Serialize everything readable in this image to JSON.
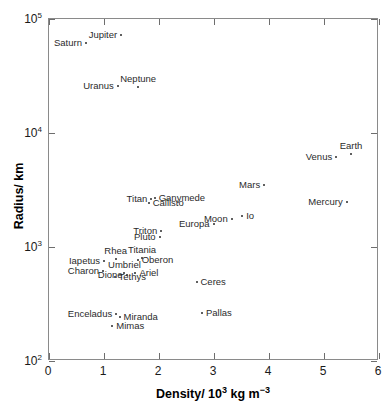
{
  "chart_data": {
    "type": "scatter",
    "title": "",
    "xlabel": "Density/ 10³ kg m⁻³",
    "ylabel": "Radius/ km",
    "xlim": [
      0,
      6
    ],
    "ylim": [
      100,
      100000
    ],
    "yscale": "log",
    "xscale": "linear",
    "grid": false,
    "legend": "none",
    "xticks": [
      {
        "value": 0,
        "label": "0"
      },
      {
        "value": 1,
        "label": "1"
      },
      {
        "value": 2,
        "label": "2"
      },
      {
        "value": 3,
        "label": "3"
      },
      {
        "value": 4,
        "label": "4"
      },
      {
        "value": 5,
        "label": "5"
      },
      {
        "value": 6,
        "label": "6"
      }
    ],
    "yticks": [
      {
        "value": 100,
        "label": "10",
        "exp": "2"
      },
      {
        "value": 1000,
        "label": "10",
        "exp": "3"
      },
      {
        "value": 10000,
        "label": "10",
        "exp": "4"
      },
      {
        "value": 100000,
        "label": "10",
        "exp": "5"
      }
    ],
    "points": [
      {
        "name": "Jupiter",
        "x": 1.33,
        "y": 71490,
        "side": "rl"
      },
      {
        "name": "Saturn",
        "x": 0.69,
        "y": 60270,
        "side": "rl"
      },
      {
        "name": "Uranus",
        "x": 1.27,
        "y": 25560,
        "side": "rl"
      },
      {
        "name": "Neptune",
        "x": 1.64,
        "y": 24760,
        "side": "ct"
      },
      {
        "name": "Earth",
        "x": 5.51,
        "y": 6378,
        "side": "ct"
      },
      {
        "name": "Venus",
        "x": 5.24,
        "y": 6052,
        "side": "rl"
      },
      {
        "name": "Mars",
        "x": 3.93,
        "y": 3397,
        "side": "rl"
      },
      {
        "name": "Mercury",
        "x": 5.43,
        "y": 2440,
        "side": "rl"
      },
      {
        "name": "Ganymede",
        "x": 1.94,
        "y": 2631,
        "side": "lr"
      },
      {
        "name": "Titan",
        "x": 1.88,
        "y": 2575,
        "side": "rl"
      },
      {
        "name": "Callisto",
        "x": 1.83,
        "y": 2400,
        "side": "lr"
      },
      {
        "name": "Io",
        "x": 3.53,
        "y": 1821,
        "side": "lr"
      },
      {
        "name": "Moon",
        "x": 3.34,
        "y": 1738,
        "side": "rl"
      },
      {
        "name": "Europa",
        "x": 3.01,
        "y": 1565,
        "side": "rl"
      },
      {
        "name": "Triton",
        "x": 2.06,
        "y": 1353,
        "side": "rl"
      },
      {
        "name": "Pluto",
        "x": 2.03,
        "y": 1195,
        "side": "rl"
      },
      {
        "name": "Titania",
        "x": 1.71,
        "y": 789,
        "side": "ct"
      },
      {
        "name": "Oberon",
        "x": 1.63,
        "y": 761,
        "side": "lr"
      },
      {
        "name": "Rhea",
        "x": 1.23,
        "y": 764,
        "side": "ct"
      },
      {
        "name": "Iapetus",
        "x": 1.02,
        "y": 736,
        "side": "rl"
      },
      {
        "name": "Charon",
        "x": 1.0,
        "y": 606,
        "side": "rl"
      },
      {
        "name": "Umbriel",
        "x": 1.39,
        "y": 585,
        "side": "ct"
      },
      {
        "name": "Ariel",
        "x": 1.59,
        "y": 579,
        "side": "lr"
      },
      {
        "name": "Dione",
        "x": 1.43,
        "y": 560,
        "side": "rl"
      },
      {
        "name": "Tethys",
        "x": 1.21,
        "y": 530,
        "side": "lr"
      },
      {
        "name": "Ceres",
        "x": 2.7,
        "y": 487,
        "side": "lr"
      },
      {
        "name": "Enceladus",
        "x": 1.24,
        "y": 252,
        "side": "rl"
      },
      {
        "name": "Miranda",
        "x": 1.3,
        "y": 236,
        "side": "lr"
      },
      {
        "name": "Mimas",
        "x": 1.17,
        "y": 199,
        "side": "lr"
      },
      {
        "name": "Pallas",
        "x": 2.8,
        "y": 261,
        "side": "lr"
      }
    ]
  }
}
